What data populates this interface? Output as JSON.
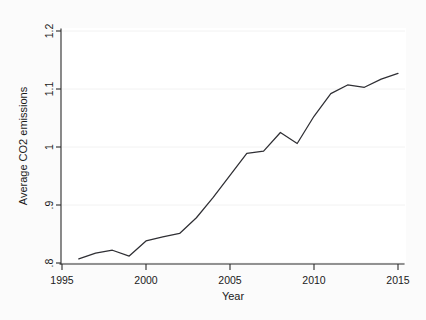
{
  "chart_data": {
    "type": "line",
    "title": "",
    "xlabel": "Year",
    "ylabel": "Average CO2 emissions",
    "xlim": [
      1995,
      2015
    ],
    "ylim": [
      0.8,
      1.2
    ],
    "xticks": [
      1995,
      2000,
      2005,
      2010,
      2015
    ],
    "xtick_labels": [
      "1995",
      "2000",
      "2005",
      "2010",
      "2015"
    ],
    "yticks": [
      0.8,
      0.9,
      1.0,
      1.1,
      1.2
    ],
    "ytick_labels": [
      ".8",
      ".9",
      "1",
      "1.1",
      "1.2"
    ],
    "grid": false,
    "legend": "none",
    "line_color": "#2f2f34",
    "series": [
      {
        "name": "Average CO2 emissions",
        "x": [
          1996,
          1997,
          1998,
          1999,
          2000,
          2001,
          2002,
          2003,
          2004,
          2005,
          2006,
          2007,
          2008,
          2009,
          2010,
          2011,
          2012,
          2013,
          2014,
          2015
        ],
        "values": [
          0.807,
          0.817,
          0.822,
          0.812,
          0.838,
          0.845,
          0.851,
          0.878,
          0.913,
          0.951,
          0.989,
          0.993,
          1.025,
          1.006,
          1.053,
          1.092,
          1.107,
          1.103,
          1.117,
          1.127
        ]
      }
    ]
  },
  "axes": {
    "x_title": "Year",
    "y_title": "Average CO2 emissions"
  }
}
